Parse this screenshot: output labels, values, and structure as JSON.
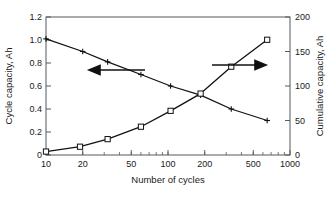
{
  "chart_data": {
    "type": "line",
    "title": "",
    "xlabel": "Number of cycles",
    "ylabel": "Cycle capacity, Ah",
    "y2label": "Cumulative capacity, Ah",
    "xscale": "log",
    "xlim": [
      10,
      1000
    ],
    "ylim": [
      0,
      1.2
    ],
    "y2lim": [
      0,
      200
    ],
    "xticks": [
      10,
      20,
      50,
      100,
      200,
      500,
      1000
    ],
    "xtick_labels": [
      "10",
      "20",
      "50",
      "100",
      "200",
      "500",
      "1000"
    ],
    "yticks": [
      0,
      0.2,
      0.4,
      0.6,
      0.8,
      1.0,
      1.2
    ],
    "ytick_labels": [
      "0",
      "0.2",
      "0.4",
      "0.6",
      "0.8",
      "1.0",
      "1.2"
    ],
    "y2ticks": [
      0,
      50,
      100,
      150,
      200
    ],
    "y2tick_labels": [
      "0",
      "50",
      "100",
      "150",
      "200"
    ],
    "grid": false,
    "legend": "none",
    "series": [
      {
        "name": "Cycle capacity",
        "axis": "left",
        "marker": "plus",
        "x": [
          10,
          20,
          32,
          60,
          105,
          185,
          330,
          650
        ],
        "values": [
          1.01,
          0.9,
          0.81,
          0.7,
          0.6,
          0.52,
          0.4,
          0.3
        ]
      },
      {
        "name": "Cumulative capacity",
        "axis": "right",
        "marker": "square",
        "x": [
          10,
          19,
          32,
          60,
          105,
          185,
          330,
          650
        ],
        "values": [
          5,
          12,
          23,
          41,
          64,
          89,
          128,
          167
        ]
      }
    ],
    "annotations": [
      {
        "name": "left-axis-arrow",
        "text": "",
        "direction": "left",
        "points_to": "Cycle capacity"
      },
      {
        "name": "right-axis-arrow",
        "text": "",
        "direction": "right",
        "points_to": "Cumulative capacity"
      }
    ]
  }
}
